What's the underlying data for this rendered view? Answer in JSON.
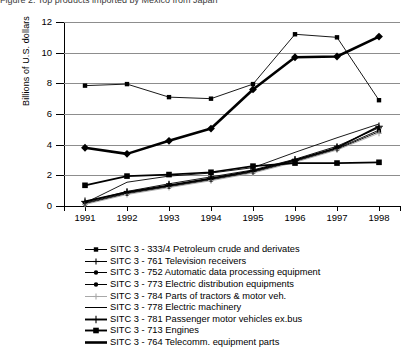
{
  "figure": {
    "title_clipped": "Figure 2. Top products imported by Mexico from Japan",
    "ylabel": "Billions of U.S. dollars"
  },
  "chart_data": {
    "type": "line",
    "title": "",
    "xlabel": "",
    "ylabel": "Billions of U.S. dollars",
    "x": [
      1991,
      1992,
      1993,
      1994,
      1995,
      1996,
      1997,
      1998
    ],
    "xtick_labels": [
      "1991",
      "1992",
      "1993",
      "1994",
      "1995",
      "1996",
      "1997",
      "1998"
    ],
    "ylim": [
      0,
      12
    ],
    "yticks": [
      0,
      2,
      4,
      6,
      8,
      10,
      12
    ],
    "ytick_labels": [
      "0",
      "2",
      "4",
      "6",
      "8",
      "10",
      "12"
    ],
    "grid": "horizontal",
    "legend_position": "below",
    "series": [
      {
        "name": "SITC 3 - 333/4 Petroleum crude and derivates",
        "marker": "square",
        "width": "thin",
        "color": "#000000",
        "values": [
          7.85,
          7.95,
          7.1,
          7.0,
          7.95,
          11.2,
          11.0,
          6.9
        ]
      },
      {
        "name": "SITC 3 - 761 Television receivers",
        "marker": "plus",
        "width": "thin",
        "color": "#000000",
        "values": [
          0.25,
          0.95,
          1.45,
          1.9,
          2.35,
          3.05,
          3.9,
          5.1
        ]
      },
      {
        "name": "SITC 3 - 752 Automatic data processing equipment",
        "marker": "circle",
        "width": "thin",
        "color": "#000000",
        "values": [
          0.2,
          0.85,
          1.3,
          1.75,
          2.25,
          2.95,
          3.75,
          4.95
        ]
      },
      {
        "name": "SITC 3 - 773 Electric distribution equipments",
        "marker": "circle",
        "width": "thin",
        "color": "#000000",
        "values": [
          0.15,
          0.8,
          1.25,
          1.7,
          2.2,
          2.9,
          3.7,
          4.85
        ]
      },
      {
        "name": "SITC 3 - 784 Parts of tractors & motor veh.",
        "marker": "plus",
        "width": "thin",
        "color": "#a8a8a8",
        "values": [
          0.1,
          0.75,
          1.2,
          1.65,
          2.15,
          2.85,
          3.65,
          4.75
        ]
      },
      {
        "name": "SITC 3 - 778 Electric machinery",
        "marker": "none",
        "width": "thin",
        "color": "#000000",
        "values": [
          0.2,
          1.55,
          1.95,
          2.15,
          2.5,
          3.5,
          4.45,
          5.35
        ]
      },
      {
        "name": "SITC 3 - 781 Passenger motor vehicles ex.bus",
        "marker": "plus",
        "width": "medium",
        "color": "#000000",
        "values": [
          0.3,
          0.9,
          1.35,
          1.8,
          2.3,
          3.0,
          3.8,
          5.2
        ]
      },
      {
        "name": "SITC 3 - 713 Engines",
        "marker": "square",
        "width": "medium",
        "color": "#000000",
        "values": [
          1.35,
          1.95,
          2.05,
          2.2,
          2.6,
          2.8,
          2.8,
          2.85
        ]
      },
      {
        "name": "SITC 3 - 764 Telecomm. equipment parts",
        "marker": "diamond",
        "width": "thick",
        "color": "#000000",
        "values": [
          3.8,
          3.4,
          4.25,
          5.05,
          7.6,
          9.7,
          9.75,
          11.05
        ]
      }
    ]
  },
  "axes": {
    "ytick_labels": [
      "12",
      "10",
      "8",
      "6",
      "4",
      "2",
      "0"
    ],
    "xtick_labels": [
      "1991",
      "1992",
      "1993",
      "1994",
      "1995",
      "1996",
      "1997",
      "1998"
    ]
  },
  "legend": {
    "items": [
      {
        "label": "SITC 3 - 333/4 Petroleum crude and derivates",
        "key": "line-square-thin"
      },
      {
        "label": "SITC 3 - 761 Television receivers",
        "key": "line-plus-thin"
      },
      {
        "label": "SITC 3 - 752 Automatic data processing equipment",
        "key": "line-circle-thin"
      },
      {
        "label": "SITC 3 - 773 Electric distribution equipments",
        "key": "line-circle-thin"
      },
      {
        "label": "SITC 3 - 784 Parts of tractors & motor veh.",
        "key": "line-plus-gray"
      },
      {
        "label": "SITC 3 - 778 Electric machinery",
        "key": "line-plain-thin"
      },
      {
        "label": "SITC 3 - 781 Passenger motor vehicles ex.bus",
        "key": "line-plus-medium"
      },
      {
        "label": "SITC 3 - 713 Engines",
        "key": "line-square-medium"
      },
      {
        "label": "SITC 3 - 764 Telecomm. equipment parts",
        "key": "line-plain-thick"
      }
    ]
  }
}
